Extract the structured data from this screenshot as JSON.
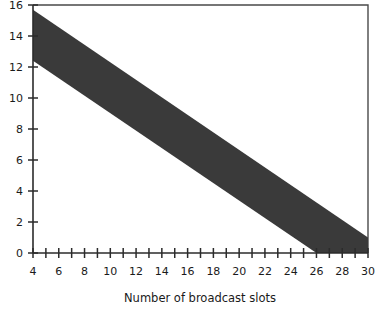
{
  "chart_data": {
    "type": "area",
    "title": "",
    "subtitle": "",
    "xlabel": "Number of broadcast slots",
    "ylabel": "",
    "xlim": [
      4,
      30
    ],
    "ylim": [
      0,
      16
    ],
    "grid": false,
    "legend": null,
    "x_ticks_major": [
      4,
      6,
      8,
      10,
      12,
      14,
      16,
      18,
      20,
      22,
      24,
      26,
      28,
      30
    ],
    "x_tick_labels": [
      "4",
      "6",
      "8",
      "10",
      "12",
      "14",
      "16",
      "18",
      "20",
      "22",
      "24",
      "26",
      "28",
      "30"
    ],
    "x_ticks_minor": [
      5,
      7,
      9,
      11,
      13,
      15,
      17,
      19,
      21,
      23,
      25,
      27,
      29
    ],
    "y_ticks_major": [
      0,
      2,
      4,
      6,
      8,
      10,
      12,
      14,
      16
    ],
    "y_tick_labels": [
      "0",
      "2",
      "4",
      "6",
      "8",
      "10",
      "12",
      "14",
      "16"
    ],
    "fill_color": "#3a3a3a",
    "axis_color": "#2b2b2b",
    "frame_color": "#4a4a4a",
    "background_color": "#ffffff",
    "series": [
      {
        "name": "upper-boundary",
        "x": [
          4,
          30
        ],
        "values": [
          15.7,
          1.0
        ]
      },
      {
        "name": "lower-boundary",
        "x": [
          4,
          26
        ],
        "values": [
          12.4,
          0.0
        ]
      }
    ],
    "shaded_region": {
      "description": "Feasible region between upper and lower boundary lines, clipped at y=0",
      "polygon_x": [
        4,
        30,
        30,
        26,
        4
      ],
      "polygon_y": [
        15.7,
        1.0,
        0.0,
        0.0,
        12.4
      ]
    }
  }
}
